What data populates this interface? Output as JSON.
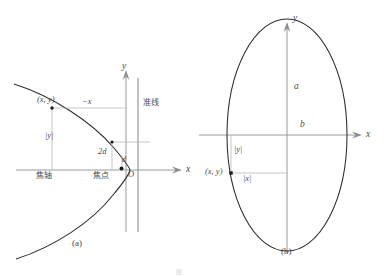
{
  "figure": {
    "panels": [
      {
        "id": "panel-a",
        "caption": "(a)",
        "type": "parabola",
        "labels": {
          "y_axis": "y",
          "x_axis": "x",
          "origin": "O",
          "point": "(x, y)",
          "neg_x": "−x",
          "abs_y": "|y|",
          "two_d": "2d",
          "d": "d",
          "directrix": "准线",
          "focal_axis": "焦轴",
          "focus": "焦点"
        }
      },
      {
        "id": "panel-b",
        "caption": "(b)",
        "type": "ellipse",
        "labels": {
          "y_axis": "y",
          "x_axis": "x",
          "semi_major": "a",
          "semi_minor": "b",
          "point": "(x, y)",
          "abs_y": "|y|",
          "abs_x": "|x|"
        }
      }
    ],
    "figure_caption": "图"
  },
  "colors": {
    "curve": "#2b2b2b",
    "axis": "#8a8a8a",
    "helper": "#a8a8a8",
    "text": "#4a4a4a",
    "background": "#ffffff"
  },
  "geometry": {
    "panel_a": {
      "origin": [
        126,
        170
      ],
      "directrix_x": 138,
      "focus": [
        122,
        168
      ],
      "point_xy": [
        52,
        108
      ]
    },
    "panel_b": {
      "center": [
        287,
        135
      ],
      "semi_x": 60,
      "semi_y": 116,
      "point_xy": [
        229,
        173
      ]
    }
  }
}
